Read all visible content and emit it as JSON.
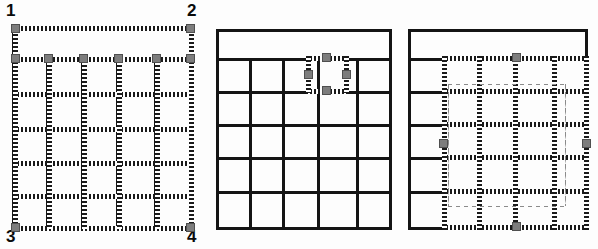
{
  "figure": {
    "background_color": "#ffffff",
    "line_color": "#141414",
    "handle_color": "#7d7d7d",
    "handle_border_color": "#4f4f4f",
    "selection_dash_color": "#1a1a1a",
    "marquee_color": "#8b8b8b"
  },
  "panels": [
    {
      "id": "panel-whole-table-selected",
      "caption": "",
      "columns": 5,
      "body_rows": 5,
      "has_header_row": true,
      "selection": {
        "type": "whole-table",
        "handle_count": 8,
        "corner_labels": [
          "1",
          "2",
          "3",
          "4"
        ]
      }
    },
    {
      "id": "panel-single-cell-selected",
      "caption": "",
      "columns": 5,
      "body_rows": 5,
      "has_header_row": true,
      "selection": {
        "type": "single-cell",
        "selected_row": 1,
        "selected_column": 4,
        "handle_count": 4
      }
    },
    {
      "id": "panel-column-range-selected",
      "caption": "",
      "columns": 5,
      "body_rows": 5,
      "has_header_row": true,
      "selection": {
        "type": "column-range",
        "selected_columns": [
          2,
          3,
          4,
          5
        ],
        "handle_count": 4,
        "has_inner_marquee": true
      }
    }
  ],
  "corner_labels": {
    "top_left": "1",
    "top_right": "2",
    "bottom_left": "3",
    "bottom_right": "4"
  }
}
